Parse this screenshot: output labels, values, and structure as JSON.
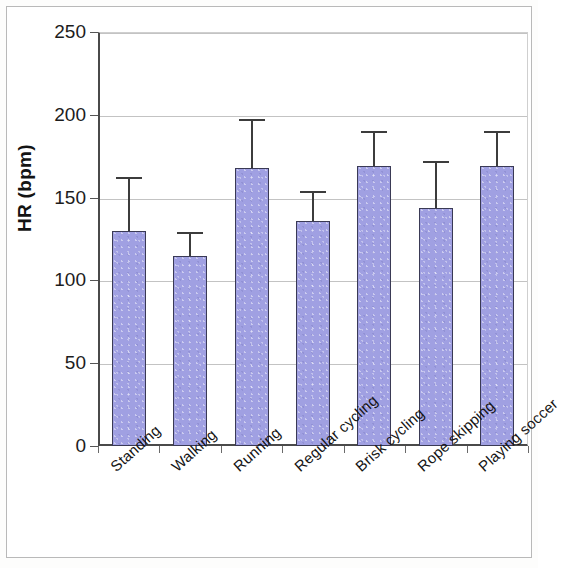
{
  "chart_data": {
    "type": "bar",
    "title": "",
    "subtitle": "",
    "xlabel": "",
    "ylabel": "HR (bpm)",
    "ylim": [
      0,
      250
    ],
    "ytick_values": [
      0,
      50,
      100,
      150,
      200,
      250
    ],
    "ytick_labels": [
      "0",
      "50",
      "100",
      "150",
      "200",
      "250"
    ],
    "grid": true,
    "legend": "none",
    "error_bar_style": "upper-only-cap",
    "categories": [
      "Standing",
      "Walking",
      "Running",
      "Regular cycling",
      "Brisk cycling",
      "Rope skipping",
      "Playing soccer"
    ],
    "values": [
      130,
      115,
      168,
      136,
      169,
      144,
      169
    ],
    "errors_upper": [
      31,
      13,
      28,
      17,
      20,
      27,
      20
    ],
    "series": [
      {
        "name": "HR (bpm)",
        "values": [
          130,
          115,
          168,
          136,
          169,
          144,
          169
        ],
        "errors_upper": [
          31,
          13,
          28,
          17,
          20,
          27,
          20
        ],
        "color": "#a0a0e2",
        "edge_color": "#3a3a55"
      }
    ]
  },
  "axis": {
    "y_title": "HR (bpm)",
    "ticks": [
      {
        "label": "250",
        "value": 250
      },
      {
        "label": "200",
        "value": 200
      },
      {
        "label": "150",
        "value": 150
      },
      {
        "label": "100",
        "value": 100
      },
      {
        "label": "50",
        "value": 50
      },
      {
        "label": "0",
        "value": 0
      }
    ]
  },
  "colors": {
    "bar_fill": "#a0a0e2",
    "bar_edge": "#3a3a55",
    "grid": "#c3c3c3",
    "axis": "#4a4a4a",
    "error_bar": "#3c3c3c",
    "background": "#ffffff"
  }
}
